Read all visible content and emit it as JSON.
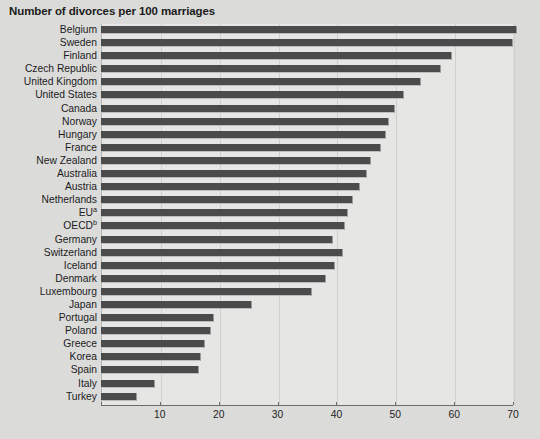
{
  "chart_data": {
    "type": "bar",
    "orientation": "horizontal",
    "title": "Number of divorces per 100 marriages",
    "xlabel": "",
    "ylabel": "",
    "xlim": [
      0,
      70
    ],
    "xticks": [
      0,
      10,
      20,
      30,
      40,
      50,
      60,
      70
    ],
    "xtick_labels": [
      "0",
      "10",
      "20",
      "30",
      "40",
      "50",
      "60",
      "70"
    ],
    "grid": true,
    "legend": null,
    "categories": [
      "Belgium",
      "Sweden",
      "Finland",
      "Czech Republic",
      "United Kingdom",
      "United States",
      "Canada",
      "Norway",
      "Hungary",
      "France",
      "New Zealand",
      "Australia",
      "Austria",
      "Netherlands",
      "EU",
      "OECD",
      "Germany",
      "Switzerland",
      "Iceland",
      "Denmark",
      "Luxembourg",
      "Japan",
      "Portugal",
      "Poland",
      "Greece",
      "Korea",
      "Spain",
      "Italy",
      "Turkey"
    ],
    "values": [
      70.6,
      70.0,
      59.6,
      57.7,
      54.3,
      51.4,
      49.9,
      49.0,
      48.4,
      47.5,
      45.8,
      45.2,
      44.0,
      42.8,
      41.9,
      41.4,
      39.5,
      41.2,
      39.8,
      38.3,
      35.9,
      25.6,
      19.2,
      18.7,
      17.7,
      17.0,
      16.6,
      9.2,
      6.1
    ],
    "footnote_markers": {
      "EU": "a",
      "OECD": "b"
    },
    "bar_color": "#4b4b4b",
    "plot_background": "#e6e6e5",
    "page_background": "#dbdbda"
  },
  "chart": {
    "title": "Number of divorces per 100 marriages"
  }
}
